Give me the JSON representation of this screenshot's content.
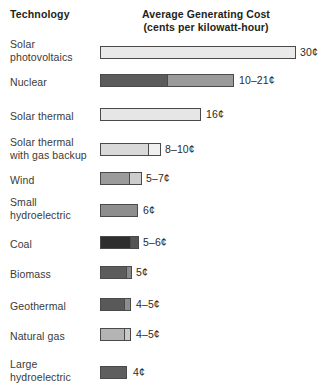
{
  "header": {
    "technology_label": "Technology",
    "cost_label_line1": "Average Generating Cost",
    "cost_label_line2": "(cents per kilowatt-hour)"
  },
  "chart_data": {
    "type": "bar",
    "title": "Average Generating Cost (cents per kilowatt-hour)",
    "xlabel": "Average Generating Cost (cents per kilowatt-hour)",
    "ylabel": "Technology",
    "orientation": "horizontal",
    "grid": false,
    "legend": "none",
    "xlim": [
      0,
      30
    ],
    "units": "cents per kilowatt-hour",
    "categories": [
      "Solar photovoltaics",
      "Nuclear",
      "Solar thermal",
      "Solar thermal with gas backup",
      "Wind",
      "Small hydroelectric",
      "Coal",
      "Biomass",
      "Geothermal",
      "Natural gas",
      "Large hydroelectric"
    ],
    "values": [
      30,
      21,
      16,
      10,
      7,
      6,
      6,
      5,
      5,
      5,
      4
    ],
    "value_low": [
      30,
      10,
      16,
      8,
      5,
      6,
      5,
      5,
      4,
      4,
      4
    ],
    "value_labels": [
      "30¢",
      "10–21¢",
      "16¢",
      "8–10¢",
      "5–7¢",
      "6¢",
      "5–6¢",
      "5¢",
      "4–5¢",
      "4–5¢",
      "4¢"
    ],
    "bar_fills": [
      "#e9e9e9",
      "#5b5b5b",
      "#e6e6e6",
      "#d9d9d9",
      "#9b9b9b",
      "#8e8e8e",
      "#2e2e2e",
      "#5c5c5c",
      "#595959",
      "#b4b4b4",
      "#5e5e5e"
    ],
    "bar_fills_upper": [
      "#e9e9e9",
      "#9a9a9a",
      "#e6e6e6",
      "#f0f0f0",
      "#cccccc",
      "#8e8e8e",
      "#555555",
      "#8a8a8a",
      "#8d8d8d",
      "#c9c9c9",
      "#5e5e5e"
    ],
    "border_color": "#4a4a4a",
    "background": "#ffffff"
  },
  "rows": [
    {
      "label": "Solar\nphotovoltaics",
      "value_label": "30¢",
      "label_top": 38,
      "bar_top": 46,
      "value_left": 300,
      "value_top": 46,
      "segments": [
        {
          "width": 196,
          "fill": "#e9e9e9"
        }
      ]
    },
    {
      "label": "Nuclear",
      "value_label": "10–21¢",
      "label_top": 76,
      "bar_top": 74,
      "value_left": 239,
      "value_top": 74,
      "segments": [
        {
          "width": 68,
          "fill": "#5b5b5b"
        },
        {
          "width": 66,
          "fill": "#9a9a9a"
        }
      ]
    },
    {
      "label": "Solar thermal",
      "value_label": "16¢",
      "label_top": 110,
      "bar_top": 108,
      "value_left": 206,
      "value_top": 108,
      "segments": [
        {
          "width": 101,
          "fill": "#e6e6e6"
        }
      ]
    },
    {
      "label": "Solar thermal\nwith gas backup",
      "value_label": "8–10¢",
      "label_top": 136,
      "bar_top": 143,
      "value_left": 165,
      "value_top": 143,
      "segments": [
        {
          "width": 49,
          "fill": "#d9d9d9"
        },
        {
          "width": 12,
          "fill": "#f0f0f0"
        }
      ]
    },
    {
      "label": "Wind",
      "value_label": "5–7¢",
      "label_top": 174,
      "bar_top": 172,
      "value_left": 146,
      "value_top": 172,
      "segments": [
        {
          "width": 30,
          "fill": "#9b9b9b"
        },
        {
          "width": 12,
          "fill": "#cccccc"
        }
      ]
    },
    {
      "label": "Small\nhydroelectric",
      "value_label": "6¢",
      "label_top": 196,
      "bar_top": 204,
      "value_left": 143,
      "value_top": 204,
      "segments": [
        {
          "width": 38,
          "fill": "#8e8e8e"
        }
      ]
    },
    {
      "label": "Coal",
      "value_label": "5–6¢",
      "label_top": 238,
      "bar_top": 236,
      "value_left": 143,
      "value_top": 236,
      "segments": [
        {
          "width": 31,
          "fill": "#2e2e2e"
        },
        {
          "width": 8,
          "fill": "#555555"
        }
      ]
    },
    {
      "label": "Biomass",
      "value_label": "5¢",
      "label_top": 268,
      "bar_top": 266,
      "value_left": 136,
      "value_top": 266,
      "segments": [
        {
          "width": 27,
          "fill": "#5c5c5c"
        },
        {
          "width": 5,
          "fill": "#8a8a8a"
        }
      ]
    },
    {
      "label": "Geothermal",
      "value_label": "4–5¢",
      "label_top": 300,
      "bar_top": 298,
      "value_left": 136,
      "value_top": 298,
      "segments": [
        {
          "width": 25,
          "fill": "#595959"
        },
        {
          "width": 6,
          "fill": "#8d8d8d"
        }
      ]
    },
    {
      "label": "Natural gas",
      "value_label": "4–5¢",
      "label_top": 330,
      "bar_top": 328,
      "value_left": 136,
      "value_top": 328,
      "segments": [
        {
          "width": 25,
          "fill": "#b4b4b4"
        },
        {
          "width": 6,
          "fill": "#c9c9c9"
        }
      ]
    },
    {
      "label": "Large\nhydroelectric",
      "value_label": "4¢",
      "label_top": 358,
      "bar_top": 366,
      "value_left": 133,
      "value_top": 366,
      "segments": [
        {
          "width": 27,
          "fill": "#5e5e5e"
        }
      ]
    }
  ]
}
